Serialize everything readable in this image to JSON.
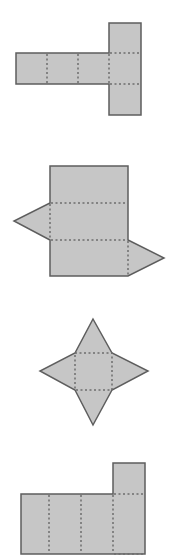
{
  "diagram": {
    "colors": {
      "fill": "#c6c6c6",
      "stroke": "#5e5e5e",
      "fold": "#6e6e6e",
      "background": "#ffffff"
    },
    "nets": [
      {
        "id": "net-1",
        "description": "T-shaped net of rectangular prism",
        "bbox": [
          16,
          23,
          141,
          115
        ]
      },
      {
        "id": "net-2",
        "description": "Triangular prism net with two triangle flaps",
        "bbox": [
          14,
          166,
          164,
          276
        ]
      },
      {
        "id": "net-3",
        "description": "Square pyramid net (star shape)",
        "bbox": [
          40,
          319,
          148,
          425
        ]
      },
      {
        "id": "net-4",
        "description": "Partial rectangular prism net",
        "bbox": [
          21,
          463,
          145,
          554
        ]
      }
    ]
  }
}
